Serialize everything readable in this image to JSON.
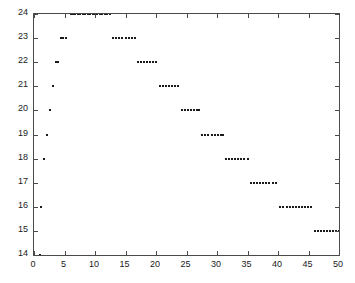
{
  "chart_data": {
    "type": "scatter",
    "title": "",
    "xlabel": "",
    "ylabel": "",
    "xlim": [
      0,
      50
    ],
    "ylim": [
      14,
      24
    ],
    "xticks": [
      0,
      5,
      10,
      15,
      20,
      25,
      30,
      35,
      40,
      45,
      50
    ],
    "yticks": [
      14,
      15,
      16,
      17,
      18,
      19,
      20,
      21,
      22,
      23,
      24
    ],
    "grid": false,
    "legend": null,
    "marker": "dot",
    "marker_color": "#1a1a1a",
    "frame_color": "#4a4a4a",
    "background": "#ffffff",
    "series": [
      {
        "name": "series-1",
        "points": [
          [
            1.0,
            14
          ],
          [
            1.2,
            16
          ],
          [
            1.6,
            18
          ],
          [
            2.1,
            19
          ],
          [
            2.6,
            20
          ],
          [
            3.1,
            21
          ],
          [
            3.6,
            22
          ],
          [
            4.0,
            22
          ],
          [
            4.4,
            23
          ],
          [
            4.8,
            23
          ],
          [
            5.2,
            23
          ],
          [
            6.0,
            24
          ],
          [
            6.4,
            24
          ],
          [
            6.8,
            24
          ],
          [
            7.2,
            24
          ],
          [
            7.6,
            24
          ],
          [
            8.0,
            24
          ],
          [
            8.4,
            24
          ],
          [
            8.8,
            24
          ],
          [
            9.2,
            24
          ],
          [
            9.6,
            24
          ],
          [
            10.0,
            24
          ],
          [
            10.4,
            24
          ],
          [
            10.8,
            24
          ],
          [
            11.2,
            24
          ],
          [
            11.6,
            24
          ],
          [
            12.0,
            24
          ],
          [
            12.4,
            24
          ],
          [
            13.0,
            23
          ],
          [
            13.5,
            23
          ],
          [
            14.0,
            23
          ],
          [
            14.5,
            23
          ],
          [
            15.0,
            23
          ],
          [
            15.5,
            23
          ],
          [
            16.0,
            23
          ],
          [
            16.5,
            23
          ],
          [
            17.0,
            22
          ],
          [
            17.5,
            22
          ],
          [
            18.0,
            22
          ],
          [
            18.5,
            22
          ],
          [
            19.0,
            22
          ],
          [
            19.5,
            22
          ],
          [
            20.0,
            22
          ],
          [
            20.6,
            21
          ],
          [
            21.1,
            21
          ],
          [
            21.6,
            21
          ],
          [
            22.1,
            21
          ],
          [
            22.6,
            21
          ],
          [
            23.1,
            21
          ],
          [
            23.6,
            21
          ],
          [
            24.2,
            20
          ],
          [
            24.7,
            20
          ],
          [
            25.2,
            20
          ],
          [
            25.7,
            20
          ],
          [
            26.2,
            20
          ],
          [
            26.7,
            20
          ],
          [
            27.1,
            20
          ],
          [
            27.6,
            19
          ],
          [
            28.1,
            19
          ],
          [
            28.6,
            19
          ],
          [
            29.1,
            19
          ],
          [
            29.6,
            19
          ],
          [
            30.1,
            19
          ],
          [
            30.6,
            19
          ],
          [
            31.0,
            19
          ],
          [
            31.5,
            18
          ],
          [
            32.0,
            18
          ],
          [
            32.5,
            18
          ],
          [
            33.0,
            18
          ],
          [
            33.5,
            18
          ],
          [
            34.0,
            18
          ],
          [
            34.5,
            18
          ],
          [
            35.0,
            18
          ],
          [
            35.6,
            17
          ],
          [
            36.1,
            17
          ],
          [
            36.6,
            17
          ],
          [
            37.1,
            17
          ],
          [
            37.6,
            17
          ],
          [
            38.1,
            17
          ],
          [
            38.6,
            17
          ],
          [
            39.1,
            17
          ],
          [
            39.6,
            17
          ],
          [
            40.4,
            16
          ],
          [
            40.9,
            16
          ],
          [
            41.4,
            16
          ],
          [
            41.9,
            16
          ],
          [
            42.4,
            16
          ],
          [
            42.9,
            16
          ],
          [
            43.4,
            16
          ],
          [
            43.9,
            16
          ],
          [
            44.4,
            16
          ],
          [
            44.9,
            16
          ],
          [
            45.4,
            16
          ],
          [
            46.0,
            15
          ],
          [
            46.5,
            15
          ],
          [
            47.0,
            15
          ],
          [
            47.5,
            15
          ],
          [
            48.0,
            15
          ],
          [
            48.5,
            15
          ],
          [
            49.0,
            15
          ],
          [
            49.5,
            15
          ],
          [
            50.0,
            15
          ]
        ]
      }
    ]
  }
}
